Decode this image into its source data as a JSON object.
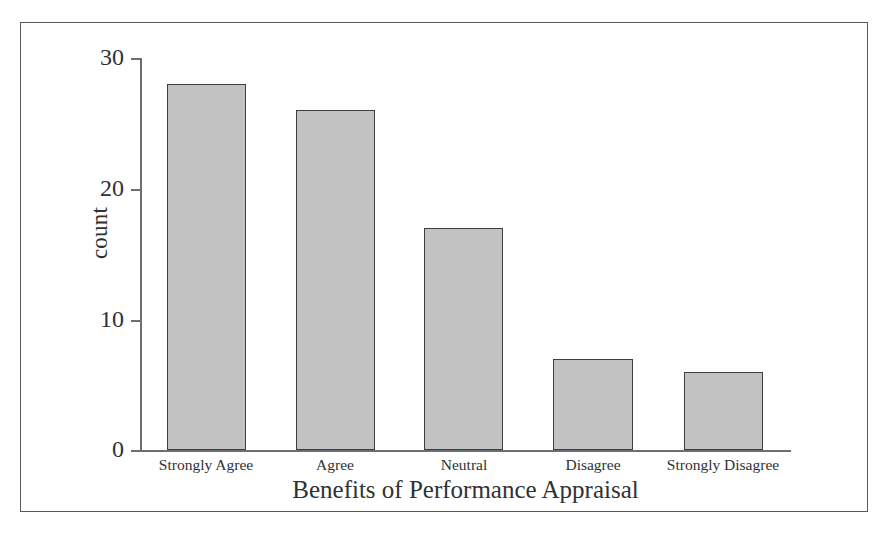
{
  "chart_data": {
    "type": "bar",
    "title": "",
    "xlabel": "Benefits of Performance Appraisal",
    "ylabel": "count",
    "categories": [
      "Strongly Agree",
      "Agree",
      "Neutral",
      "Disagree",
      "Strongly Disagree"
    ],
    "values": [
      28,
      26,
      17,
      7,
      6
    ],
    "ylim": [
      0,
      30
    ],
    "yticks": [
      0,
      10,
      20,
      30
    ],
    "ytick_labels": [
      "0",
      "10",
      "20",
      "30"
    ],
    "grid": false,
    "legend": null,
    "bar_fill_color": "#c2c2c2",
    "bar_edge_color": "#3c3f41",
    "axis_color": "#6a6f72",
    "text_color": "#2e3234",
    "frame_color": "#555c5f",
    "background_color": "#ffffff"
  },
  "figure": {
    "border_visible": true
  }
}
